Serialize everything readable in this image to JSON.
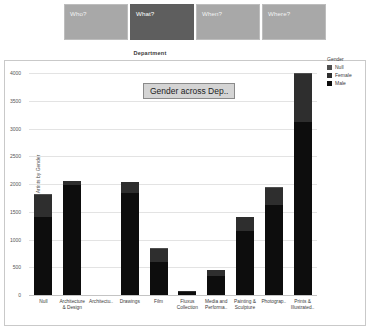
{
  "tabs": [
    {
      "label": "Who?",
      "selected": false
    },
    {
      "label": "What?",
      "selected": true
    },
    {
      "label": "When?",
      "selected": false
    },
    {
      "label": "Where?",
      "selected": false
    }
  ],
  "panel": {
    "title": "Department"
  },
  "chart_title_box": {
    "text": "Gender across Dep.."
  },
  "legend": {
    "title": "Gender",
    "entries": [
      {
        "label": "Null",
        "color": "#4f4f4f"
      },
      {
        "label": "Female",
        "color": "#2e2e2e"
      },
      {
        "label": "Male",
        "color": "#0d0d0d"
      }
    ]
  },
  "chart_data": {
    "type": "bar",
    "title": "Gender across Dep..",
    "xlabel": "Department",
    "ylabel": "Count of Artists by Gender",
    "ylim": [
      0,
      4000
    ],
    "yticks": [
      0,
      500,
      1000,
      1500,
      2000,
      2500,
      3000,
      3500,
      4000
    ],
    "ytick_labels": [
      "0",
      "500",
      "1000",
      "1500",
      "2000",
      "2500",
      "3000",
      "3500",
      "4000"
    ],
    "grid": true,
    "stacked": true,
    "legend_position": "right",
    "categories": [
      "Null",
      "Architecture & Design",
      "Architectu..",
      "Drawings",
      "Film",
      "Fluxus Collection",
      "Media and Performa..",
      "Painting & Sculpture",
      "Photograp..",
      "Prints & Illustrated.."
    ],
    "series": [
      {
        "name": "Male",
        "color": "#0d0d0d",
        "values": [
          1410,
          1990,
          0,
          1830,
          590,
          50,
          340,
          1150,
          1630,
          3150
        ]
      },
      {
        "name": "Female",
        "color": "#2e2e2e",
        "values": [
          400,
          60,
          0,
          200,
          240,
          20,
          110,
          250,
          300,
          880
        ]
      },
      {
        "name": "Null",
        "color": "#4f4f4f",
        "values": [
          10,
          10,
          0,
          10,
          10,
          5,
          10,
          10,
          10,
          20
        ]
      }
    ],
    "totals": [
      1820,
      2060,
      0,
      2040,
      840,
      75,
      460,
      1410,
      1940,
      4050
    ]
  }
}
